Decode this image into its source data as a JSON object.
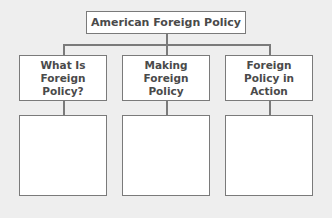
{
  "diagram": {
    "type": "tree",
    "root": {
      "label": "American Foreign Policy"
    },
    "categories": [
      {
        "label": "What Is\nForeign\nPolicy?",
        "notes": ""
      },
      {
        "label": "Making\nForeign\nPolicy",
        "notes": ""
      },
      {
        "label": "Foreign\nPolicy in\nAction",
        "notes": ""
      }
    ]
  },
  "colors": {
    "background": "#eeeeee",
    "box_fill": "#ffffff",
    "border": "#7a7a7a",
    "text": "#4a4a4a"
  }
}
